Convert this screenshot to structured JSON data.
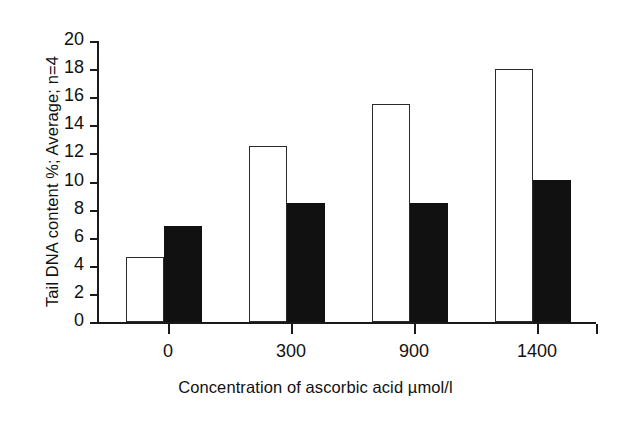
{
  "chart_data": {
    "type": "bar",
    "title": "",
    "subtitle": "",
    "categories": [
      "0",
      "300",
      "900",
      "1400"
    ],
    "series": [
      {
        "name": "open-bars",
        "style": "white-outlined",
        "values": [
          4.6,
          12.5,
          15.5,
          18.0
        ]
      },
      {
        "name": "filled-bars",
        "style": "black-filled",
        "values": [
          6.8,
          8.5,
          8.5,
          10.1
        ]
      }
    ],
    "xlabel": "Concentration of ascorbic acid µmol/l",
    "ylabel": "Tail DNA content %; Average; n=4",
    "ylim": [
      0,
      20
    ],
    "ytick_step": 2,
    "yticks": [
      "20",
      "18",
      "16",
      "14",
      "12",
      "10",
      "8",
      "6",
      "4",
      "2",
      "0"
    ],
    "ytick_values": [
      20,
      18,
      16,
      14,
      12,
      10,
      8,
      6,
      4,
      2,
      0
    ],
    "grid": false,
    "legend": "none",
    "colors": {
      "axis": "#1a1a1a",
      "open_fill": "#ffffff",
      "open_stroke": "#2a2a2a",
      "filled_fill": "#111111",
      "background": "#ffffff"
    }
  }
}
